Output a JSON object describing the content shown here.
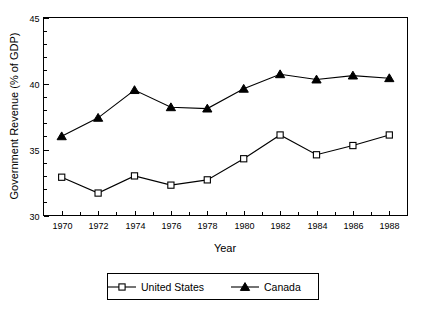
{
  "chart_data": {
    "type": "line",
    "title": "",
    "xlabel": "Year",
    "ylabel": "Government Revenue (% of GDP)",
    "x": [
      1970,
      1972,
      1974,
      1976,
      1978,
      1980,
      1982,
      1984,
      1986,
      1988
    ],
    "xtick_labels": [
      "1970",
      "1972",
      "1974",
      "1976",
      "1978",
      "1980",
      "1982",
      "1984",
      "1986",
      "1988"
    ],
    "ytick_labels": [
      "30",
      "35",
      "40",
      "45"
    ],
    "ytick_values": [
      30,
      35,
      40,
      45
    ],
    "xlim": [
      1969,
      1989
    ],
    "ylim": [
      30,
      45
    ],
    "y_minor_step": 1,
    "grid": false,
    "legend_position": "below",
    "series": [
      {
        "name": "United States",
        "marker": "open-square",
        "values": [
          32.9,
          31.7,
          33.0,
          32.3,
          32.7,
          34.3,
          36.1,
          34.6,
          35.3,
          36.1
        ]
      },
      {
        "name": "Canada",
        "marker": "filled-triangle",
        "values": [
          36.0,
          37.4,
          39.5,
          38.2,
          38.1,
          39.6,
          40.7,
          40.3,
          40.6,
          40.4
        ]
      }
    ]
  },
  "legend": {
    "entries": [
      {
        "label": "United States"
      },
      {
        "label": "Canada"
      }
    ]
  },
  "axes": {
    "x_title": "Year",
    "y_title": "Government Revenue (% of GDP)"
  }
}
